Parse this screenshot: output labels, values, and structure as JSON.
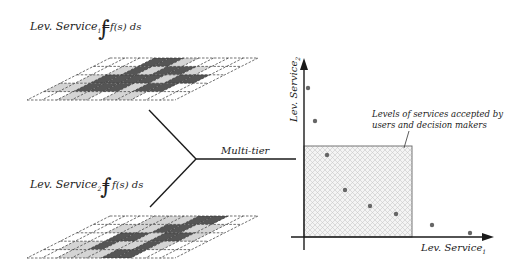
{
  "formulas": {
    "top": {
      "lhs": "Lev. Service",
      "sub": "1",
      "eq": "=",
      "integral": "∫",
      "integrand": "f(s) ds"
    },
    "bottom": {
      "lhs": "Lev. Service",
      "sub": "2",
      "eq": "=",
      "integral": "∫",
      "integrand": "f(s) ds"
    }
  },
  "junction": {
    "label": "Multi-tier"
  },
  "plot": {
    "x_label": "Lev. Service",
    "x_sub": "1",
    "y_label": "Lev. Service",
    "y_sub": "2",
    "annotation_line1": "Levels of services accepted by",
    "annotation_line2": "users and decision makers",
    "points": [
      [
        308,
        88
      ],
      [
        315,
        121
      ],
      [
        327,
        155
      ],
      [
        345,
        190
      ],
      [
        370,
        206
      ],
      [
        396,
        214
      ],
      [
        432,
        225
      ],
      [
        470,
        233
      ]
    ]
  },
  "colors": {
    "line": "#1a1a1a",
    "dark_cell": "#555555",
    "light_cell": "#d4d4d4",
    "point": "#666666",
    "box_border": "#777777"
  }
}
